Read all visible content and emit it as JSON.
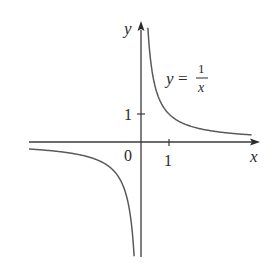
{
  "chart_data": {
    "type": "line",
    "title": "",
    "function": "y = 1/x",
    "xlabel": "x",
    "ylabel": "y",
    "x_ticks": [
      {
        "value": 1,
        "label": "1"
      }
    ],
    "y_ticks": [
      {
        "value": 1,
        "label": "1"
      }
    ],
    "origin_label": "0",
    "xlim": [
      -4,
      4.2
    ],
    "ylim": [
      -4.1,
      4.3
    ],
    "grid": false,
    "legend": null,
    "annotations": [
      {
        "text": "y = 1/x",
        "x": 2.5,
        "y": 2.8
      }
    ],
    "series": [
      {
        "name": "y = 1/x (x > 0)",
        "x": [
          0.24,
          0.3,
          0.4,
          0.5,
          0.75,
          1,
          1.5,
          2,
          3,
          4
        ],
        "y": [
          4.17,
          3.33,
          2.5,
          2.0,
          1.33,
          1.0,
          0.67,
          0.5,
          0.33,
          0.25
        ]
      },
      {
        "name": "y = 1/x (x < 0)",
        "x": [
          -4,
          -3,
          -2,
          -1.5,
          -1,
          -0.75,
          -0.5,
          -0.4,
          -0.3,
          -0.24
        ],
        "y": [
          -0.25,
          -0.33,
          -0.5,
          -0.67,
          -1.0,
          -1.33,
          -2.0,
          -2.5,
          -3.33,
          -4.17
        ]
      }
    ],
    "colors": {
      "curve": "#5a5a5a",
      "axis": "#3a3a3a",
      "text": "#2a2a2a"
    }
  },
  "labels": {
    "y_axis": "y",
    "x_axis": "x",
    "origin": "0",
    "x_tick_1": "1",
    "y_tick_1": "1",
    "eq_lhs": "y = ",
    "eq_num": "1",
    "eq_den": "x"
  }
}
